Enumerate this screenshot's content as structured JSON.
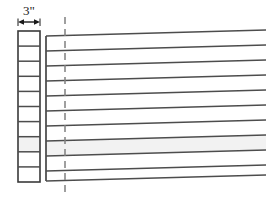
{
  "diagram": {
    "canvas": {
      "width": 276,
      "height": 203,
      "background": "#ffffff"
    },
    "colors": {
      "line": "#4d4d4d",
      "outline": "#3a3a3a",
      "dashed": "#808080",
      "text": "#1a1a1a",
      "shaded_band": "#f2f2f2"
    },
    "dimension": {
      "label": "3\"",
      "value": 3,
      "unit": "inch",
      "arrow_style": "double-headed",
      "measures": "left-column-width",
      "label_x": 29,
      "label_y": 15,
      "arrow_y": 22,
      "arrow_x1": 18,
      "arrow_x2": 40
    },
    "left_column": {
      "name": "segmented-scale-column",
      "x": 18,
      "y": 31,
      "width": 22,
      "height": 151,
      "cell_count": 10,
      "divider_y": [
        46.1,
        61.2,
        76.3,
        91.4,
        106.5,
        121.6,
        136.7,
        151.8,
        166.9
      ],
      "shaded_cell_index": 7
    },
    "main_panel": {
      "name": "layered-strata-panel",
      "x_left": 46,
      "x_right": 266,
      "y_top": 36,
      "y_bottom": 181,
      "band_count": 10,
      "left_edge_visible": true,
      "right_edge_visible": false,
      "slant_rise_px": 6,
      "shaded_band_index": 7,
      "line_y_left": [
        36,
        51,
        66,
        81,
        96,
        111,
        126,
        141,
        156,
        171,
        181
      ],
      "line_y_right": [
        30,
        45,
        60,
        75,
        90,
        105,
        120,
        135,
        150,
        165,
        175
      ]
    },
    "center_line": {
      "name": "vertical-dashed-centerline",
      "x": 65,
      "y_top": 17,
      "y_bottom": 197,
      "dash_pattern": "7 5",
      "style": "dashed"
    }
  }
}
